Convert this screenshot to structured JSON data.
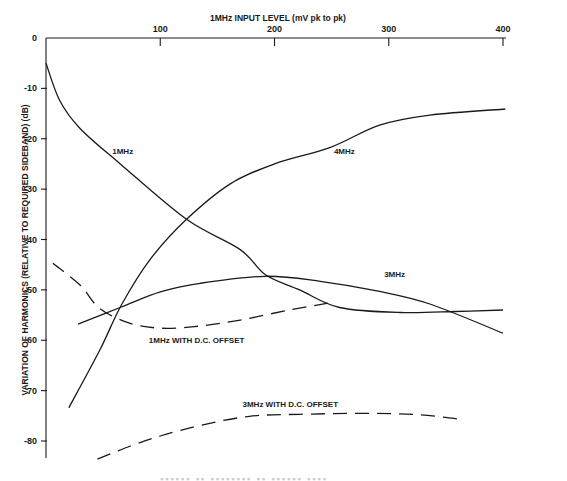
{
  "chart_data": {
    "type": "line",
    "title": "1MHz INPUT LEVEL (mV pk to pk)",
    "xlabel": "1MHz INPUT LEVEL (mV pk to pk)",
    "ylabel": "VARIATION OF HARMONICS (RELATIVE TO REQUIRED SIDEBAND) (dB)",
    "x_axis_position": "top",
    "xlim": [
      0,
      400
    ],
    "ylim": [
      -84,
      0
    ],
    "x_ticks": [
      100,
      200,
      300,
      400
    ],
    "x_tick_labels": [
      "100",
      "200",
      "300",
      "400"
    ],
    "y_ticks": [
      0,
      -10,
      -20,
      -30,
      -40,
      -50,
      -60,
      -70,
      -80
    ],
    "y_tick_labels": [
      "0",
      "-10",
      "-20",
      "-30",
      "-40",
      "-50",
      "60",
      "70",
      "-80"
    ],
    "grid": false,
    "legend": "none (inline curve labels)",
    "series": [
      {
        "name": "1MHz",
        "style": "solid",
        "x": [
          0,
          12,
          30,
          65,
          123,
          170,
          192,
          222,
          257,
          310,
          358,
          400
        ],
        "values": [
          -5,
          -12.4,
          -18,
          -25,
          -36,
          -42,
          -47,
          -50,
          -53.5,
          -54.5,
          -54.3,
          -54
        ]
      },
      {
        "name": "4MHz",
        "style": "solid",
        "x": [
          20,
          47,
          66,
          91,
          123,
          161,
          200,
          249,
          292,
          336,
          402
        ],
        "values": [
          -73.4,
          -62,
          -53,
          -44,
          -36,
          -29,
          -25,
          -21.7,
          -17.3,
          -15.3,
          -14.1
        ]
      },
      {
        "name": "3MHz",
        "style": "solid",
        "x": [
          28,
          66,
          100,
          135,
          192,
          240,
          292,
          336,
          400
        ],
        "values": [
          -56.8,
          -53.4,
          -50.4,
          -48.7,
          -47.3,
          -48.3,
          -50.3,
          -52.8,
          -58.6
        ]
      },
      {
        "name": "1MHz WITH D.C. OFFSET",
        "style": "dashed",
        "x": [
          6,
          30,
          47,
          73,
          100,
          130,
          170,
          213,
          253
        ],
        "values": [
          -44.7,
          -49.1,
          -53.7,
          -56.6,
          -57.6,
          -57.3,
          -56,
          -54,
          -52.4
        ]
      },
      {
        "name": "3MHz WITH D.C. OFFSET",
        "style": "dashed",
        "x": [
          45,
          74,
          100,
          135,
          178,
          222,
          283,
          327,
          360
        ],
        "values": [
          -83.6,
          -81,
          -79,
          -76.9,
          -75.1,
          -74.7,
          -74.5,
          -74.8,
          -75.6
        ]
      }
    ],
    "annotations": [
      {
        "text": "1MHz",
        "x": 58,
        "y": -23
      },
      {
        "text": "4MHz",
        "x": 252,
        "y": -23
      },
      {
        "text": "3MHz",
        "x": 296,
        "y": -47.5
      },
      {
        "text": "1MHz WITH D.C. OFFSET",
        "x": 90,
        "y": -60.6
      },
      {
        "text": "3MHz WITH D.C. OFFSET",
        "x": 172,
        "y": -73.2
      }
    ]
  },
  "labels": {
    "x_axis_title": "1MHz INPUT LEVEL (mV pk to pk)",
    "y_axis_title": "VARIATION OF HARMONICS (RELATIVE TO REQUIRED SIDEBAND) (dB)",
    "caption_cut_off": "▪▪▪▪▪▪ ▪▪ ▪▪▪▪▪▪▪▪ ▪▪ ▪▪▪▪▪▪ ▪▪▪▪"
  }
}
